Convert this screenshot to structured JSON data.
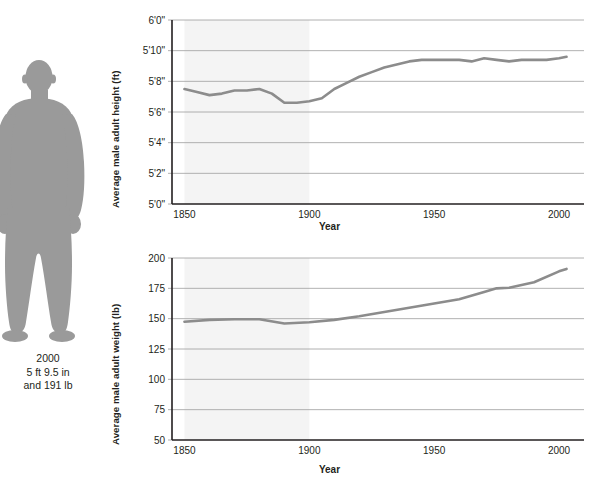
{
  "figure": {
    "icon": "male-silhouette",
    "fill_color": "#9a9a9a",
    "caption_year": "2000",
    "caption_height": "5 ft 9.5 in",
    "caption_weight": "and 191 lb"
  },
  "chart_data": [
    {
      "id": "height-chart",
      "type": "line",
      "title": "",
      "xlabel": "Year",
      "ylabel": "Average male adult height (ft)",
      "xlim": [
        1845,
        2010
      ],
      "ylim": [
        60,
        72
      ],
      "xticks": [
        1850,
        1900,
        1950,
        2000
      ],
      "xticklabels": [
        "1850",
        "1900",
        "1950",
        "2000"
      ],
      "yticks": [
        60,
        62,
        64,
        66,
        68,
        70,
        72
      ],
      "yticklabels": [
        "5'0\"",
        "5'2\"",
        "5'4\"",
        "5'6\"",
        "5'8\"",
        "5'10\"",
        "6'0\""
      ],
      "grid": true,
      "legend": "none",
      "shaded_band": {
        "x0": 1850,
        "x1": 1900,
        "color": "#f4f4f4"
      },
      "line_color": "#8c8c8c",
      "series": [
        {
          "name": "Average male adult height",
          "x": [
            1850,
            1855,
            1860,
            1865,
            1870,
            1875,
            1880,
            1885,
            1890,
            1895,
            1900,
            1905,
            1910,
            1915,
            1920,
            1925,
            1930,
            1935,
            1940,
            1945,
            1950,
            1955,
            1960,
            1965,
            1970,
            1975,
            1980,
            1985,
            1990,
            1995,
            2000,
            2003
          ],
          "values": [
            67.5,
            67.3,
            67.1,
            67.2,
            67.4,
            67.4,
            67.5,
            67.2,
            66.6,
            66.6,
            66.7,
            66.9,
            67.5,
            67.9,
            68.3,
            68.6,
            68.9,
            69.1,
            69.3,
            69.4,
            69.4,
            69.4,
            69.4,
            69.3,
            69.5,
            69.4,
            69.3,
            69.4,
            69.4,
            69.4,
            69.5,
            69.6
          ]
        }
      ]
    },
    {
      "id": "weight-chart",
      "type": "line",
      "title": "",
      "xlabel": "Year",
      "ylabel": "Average male adult weight (lb)",
      "xlim": [
        1845,
        2010
      ],
      "ylim": [
        50,
        200
      ],
      "xticks": [
        1850,
        1900,
        1950,
        2000
      ],
      "xticklabels": [
        "1850",
        "1900",
        "1950",
        "2000"
      ],
      "yticks": [
        50,
        75,
        100,
        125,
        150,
        175,
        200
      ],
      "yticklabels": [
        "50",
        "75",
        "100",
        "125",
        "150",
        "175",
        "200"
      ],
      "grid": true,
      "legend": "none",
      "shaded_band": {
        "x0": 1850,
        "x1": 1900,
        "color": "#f4f4f4"
      },
      "line_color": "#8c8c8c",
      "series": [
        {
          "name": "Average male adult weight",
          "x": [
            1850,
            1860,
            1870,
            1880,
            1890,
            1900,
            1910,
            1920,
            1930,
            1940,
            1950,
            1960,
            1970,
            1975,
            1980,
            1990,
            2000,
            2003
          ],
          "values": [
            147.5,
            149.0,
            149.5,
            149.5,
            146.0,
            147.0,
            149.0,
            152.0,
            155.5,
            159.0,
            162.5,
            166.0,
            172.0,
            175.0,
            175.5,
            180.0,
            189.0,
            191.0
          ]
        }
      ]
    }
  ]
}
